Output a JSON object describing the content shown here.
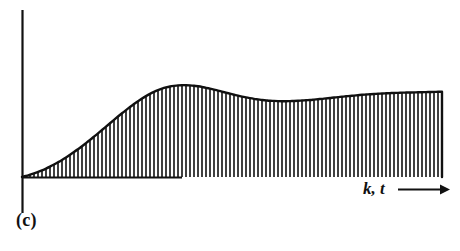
{
  "figure": {
    "panel_label": "(c)",
    "axis_label": "k, t",
    "axis_arrow_icon": "right-arrow-icon",
    "background_color": "#ffffff",
    "ink_color": "#111111"
  },
  "chart_data": {
    "type": "bar",
    "title": "",
    "subtitle": "",
    "xlabel": "k, t",
    "ylabel": "",
    "grid": false,
    "legend": null,
    "annotations": [
      {
        "text": "(c)",
        "position": "bottom-left"
      },
      {
        "text": "k, t",
        "position": "x-axis-right",
        "arrow": "right"
      }
    ],
    "axes": {
      "x_axis_origin_px": 22,
      "x_axis_baseline_px": 177,
      "x_axis_end_px": 448,
      "y_axis_top_px": 10,
      "y_axis_bottom_px": 213,
      "xlim": [
        0,
        100
      ],
      "ylim": [
        0,
        1.25
      ],
      "x_ticks": [],
      "y_ticks": []
    },
    "x": [
      0,
      1,
      2,
      3,
      4,
      5,
      6,
      7,
      8,
      9,
      10,
      11,
      12,
      13,
      14,
      15,
      16,
      17,
      18,
      19,
      20,
      21,
      22,
      23,
      24,
      25,
      26,
      27,
      28,
      29,
      30,
      31,
      32,
      33,
      34,
      35,
      36,
      37,
      38,
      39,
      40,
      41,
      42,
      43,
      44,
      45,
      46,
      47,
      48,
      49,
      50,
      51,
      52,
      53,
      54,
      55,
      56,
      57,
      58,
      59,
      60,
      61,
      62,
      63,
      64,
      65,
      66,
      67,
      68,
      69,
      70,
      71,
      72,
      73,
      74,
      75,
      76,
      77,
      78,
      79,
      80,
      81,
      82,
      83,
      84,
      85,
      86,
      87,
      88,
      89,
      90,
      91,
      92,
      93,
      94,
      95,
      96,
      97,
      98,
      99,
      100,
      101,
      102,
      103,
      104,
      105
    ],
    "values": [
      0.0,
      0.011,
      0.024,
      0.038,
      0.054,
      0.071,
      0.09,
      0.111,
      0.133,
      0.157,
      0.182,
      0.209,
      0.237,
      0.266,
      0.297,
      0.329,
      0.362,
      0.396,
      0.431,
      0.466,
      0.502,
      0.538,
      0.574,
      0.61,
      0.646,
      0.681,
      0.715,
      0.748,
      0.78,
      0.81,
      0.838,
      0.864,
      0.888,
      0.909,
      0.928,
      0.944,
      0.957,
      0.967,
      0.974,
      0.979,
      0.981,
      0.981,
      0.979,
      0.975,
      0.969,
      0.962,
      0.953,
      0.944,
      0.934,
      0.923,
      0.912,
      0.901,
      0.89,
      0.879,
      0.869,
      0.859,
      0.85,
      0.842,
      0.835,
      0.829,
      0.823,
      0.819,
      0.815,
      0.813,
      0.811,
      0.81,
      0.81,
      0.811,
      0.812,
      0.814,
      0.817,
      0.82,
      0.823,
      0.827,
      0.831,
      0.835,
      0.84,
      0.844,
      0.849,
      0.853,
      0.858,
      0.862,
      0.866,
      0.87,
      0.874,
      0.878,
      0.881,
      0.884,
      0.887,
      0.889,
      0.892,
      0.894,
      0.896,
      0.898,
      0.899,
      0.901,
      0.902,
      0.903,
      0.904,
      0.905,
      0.906,
      0.907,
      0.908,
      0.909,
      0.91,
      0.911
    ],
    "envelope": {
      "name": "continuous response envelope",
      "style": "solid-thick",
      "color": "#111111"
    },
    "stems": {
      "count": 106,
      "spacing_px": 4.0,
      "width_px": 1.6,
      "color": "#111111"
    }
  }
}
